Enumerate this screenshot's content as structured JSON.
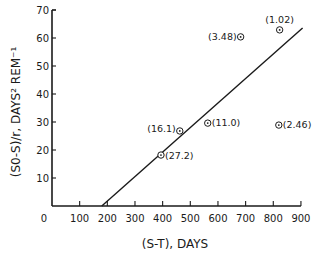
{
  "chart_data": {
    "type": "scatter",
    "title": "",
    "xlabel": "(S-T), DAYS",
    "ylabel": "(S0-S)/r, DAYS² REM⁻¹",
    "xlim": [
      0,
      900
    ],
    "ylim": [
      0,
      70
    ],
    "xticks": [
      0,
      100,
      200,
      300,
      400,
      500,
      600,
      700,
      800,
      900
    ],
    "yticks": [
      10,
      20,
      30,
      40,
      50,
      60,
      70
    ],
    "grid": false,
    "legend": null,
    "series": [
      {
        "name": "observations",
        "marker": "circled-dot",
        "points": [
          {
            "x": 394,
            "y": 18.2,
            "label": "(27.2)"
          },
          {
            "x": 462,
            "y": 26.8,
            "label": "(16.1)"
          },
          {
            "x": 563,
            "y": 29.6,
            "label": "(11.0)"
          },
          {
            "x": 682,
            "y": 60.4,
            "label": "(3.48)"
          },
          {
            "x": 820,
            "y": 28.9,
            "label": "(2.46)"
          },
          {
            "x": 823,
            "y": 62.9,
            "label": "(1.02)"
          }
        ]
      },
      {
        "name": "fit line",
        "type": "line",
        "points": [
          {
            "x": 180,
            "y": 0
          },
          {
            "x": 906,
            "y": 63.6
          }
        ]
      }
    ]
  }
}
